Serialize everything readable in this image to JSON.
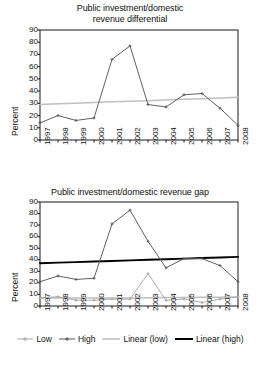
{
  "colors": {
    "high_series": "#595959",
    "low_series": "#a6a6a6",
    "linear_low": "#bfbfbf",
    "linear_high": "#000000",
    "top_series": "#595959",
    "top_linear": "#c0c0c0",
    "axis": "#000000",
    "text": "#111111",
    "background": "#ffffff"
  },
  "axis": {
    "ylabel": "Percent",
    "yticks": [
      "0",
      "10",
      "20",
      "30",
      "40",
      "50",
      "60",
      "70",
      "80",
      "90"
    ],
    "xticks": [
      "1997",
      "1998",
      "1999",
      "2000",
      "2001",
      "2002",
      "2003",
      "2004",
      "2005",
      "2006",
      "2007",
      "2008"
    ]
  },
  "top_chart": {
    "title_line1": "Public investment/domestic",
    "title_line2": "revenue differential"
  },
  "bottom_chart": {
    "title_line1": "Public investment/domestic revenue gap",
    "legend": [
      {
        "label": "Low",
        "marker": "line-with-cross-marker",
        "color": "#a6a6a6"
      },
      {
        "label": "High",
        "marker": "line-with-cross-marker",
        "color": "#595959"
      },
      {
        "label": "Linear (low)",
        "marker": "plain-line",
        "color": "#bfbfbf"
      },
      {
        "label": "Linear (high)",
        "marker": "plain-line-bold",
        "color": "#000000"
      }
    ]
  },
  "chart_data": [
    {
      "type": "line",
      "title": "Public investment/domestic revenue differential",
      "xlabel": "",
      "ylabel": "Percent",
      "ylim": [
        0,
        90
      ],
      "ytick_step": 10,
      "grid": false,
      "legend_position": "none",
      "categories": [
        "1997",
        "1998",
        "1999",
        "2000",
        "2001",
        "2002",
        "2003",
        "2004",
        "2005",
        "2006",
        "2007",
        "2008"
      ],
      "series": [
        {
          "name": "Differential",
          "color": "#595959",
          "markers": true,
          "values": [
            14,
            20,
            16,
            18,
            66,
            77,
            29,
            27,
            37,
            38,
            26,
            12
          ]
        },
        {
          "name": "Linear trend",
          "color": "#c0c0c0",
          "markers": false,
          "trendline": true,
          "values": [
            29,
            29.6,
            30.1,
            30.6,
            31.2,
            31.7,
            32.2,
            32.8,
            33.3,
            33.8,
            34.4,
            35
          ]
        }
      ]
    },
    {
      "type": "line",
      "title": "Public investment/domestic revenue gap",
      "xlabel": "",
      "ylabel": "Percent",
      "ylim": [
        0,
        90
      ],
      "ytick_step": 10,
      "grid": false,
      "legend_position": "bottom",
      "categories": [
        "1997",
        "1998",
        "1999",
        "2000",
        "2001",
        "2002",
        "2003",
        "2004",
        "2005",
        "2006",
        "2007",
        "2008"
      ],
      "series": [
        {
          "name": "Low",
          "color": "#a6a6a6",
          "markers": true,
          "values": [
            7,
            8,
            5,
            5,
            6,
            6,
            28,
            5,
            6,
            3,
            6,
            8
          ]
        },
        {
          "name": "High",
          "color": "#595959",
          "markers": true,
          "values": [
            21,
            26,
            23,
            24,
            71,
            83,
            56,
            33,
            41,
            41,
            35,
            21
          ]
        },
        {
          "name": "Linear (low)",
          "color": "#bfbfbf",
          "markers": false,
          "trendline": true,
          "values": [
            7,
            7,
            7,
            7,
            7,
            7,
            7.2,
            7.3,
            7.4,
            7.5,
            7.6,
            7.7
          ]
        },
        {
          "name": "Linear (high)",
          "color": "#000000",
          "markers": false,
          "trendline": true,
          "values": [
            37,
            37.5,
            38,
            38.5,
            39,
            39.5,
            40,
            40.5,
            41,
            41.5,
            42,
            42.5
          ]
        }
      ]
    }
  ]
}
